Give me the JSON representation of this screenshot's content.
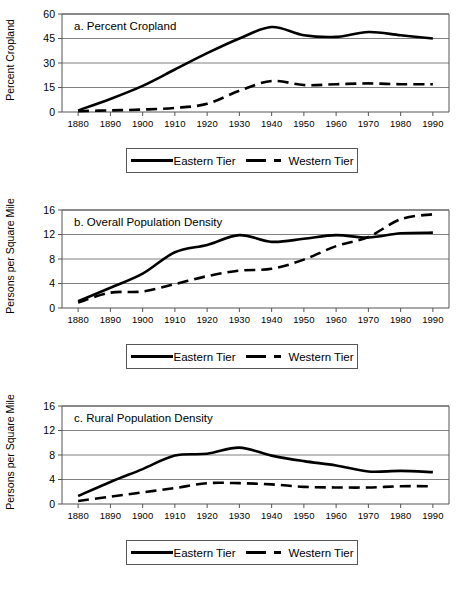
{
  "figure": {
    "x_tick_labels": [
      "1880",
      "1890",
      "1900",
      "1910",
      "1920",
      "1930",
      "1940",
      "1950",
      "1960",
      "1970",
      "1980",
      "1990"
    ],
    "legend": {
      "eastern_label": "Eastern Tier",
      "western_label": "Western Tier",
      "eastern_icon": "solid-line-icon",
      "western_icon": "dashed-line-icon"
    },
    "colors": {
      "series": "#000000",
      "gridline": "#808080",
      "axis": "#555555",
      "background": "#ffffff"
    }
  },
  "chart_data": [
    {
      "type": "line",
      "title": "a. Percent Cropland",
      "xlabel": "",
      "ylabel": "Percent Cropland",
      "xlim": [
        1875,
        1995
      ],
      "ylim": [
        0,
        60
      ],
      "yticks": [
        0,
        15,
        30,
        45,
        60
      ],
      "ytick_labels": [
        "0",
        "15",
        "30",
        "45",
        "60"
      ],
      "grid": true,
      "legend_position": "below",
      "x": [
        1880,
        1890,
        1900,
        1910,
        1920,
        1930,
        1940,
        1950,
        1960,
        1970,
        1980,
        1990
      ],
      "series": [
        {
          "name": "Eastern Tier",
          "style": "solid",
          "values": [
            1,
            8,
            16,
            26,
            36,
            45,
            52,
            47,
            46,
            49,
            47,
            45
          ]
        },
        {
          "name": "Western Tier",
          "style": "dashed",
          "values": [
            0.5,
            1,
            1.5,
            2.5,
            5,
            13,
            19,
            16.5,
            17,
            17.5,
            17,
            17
          ]
        }
      ]
    },
    {
      "type": "line",
      "title": "b. Overall Population Density",
      "xlabel": "",
      "ylabel": "Persons per Square Mile",
      "xlim": [
        1875,
        1995
      ],
      "ylim": [
        0,
        16
      ],
      "yticks": [
        0,
        4,
        8,
        12,
        16
      ],
      "ytick_labels": [
        "0",
        "4",
        "8",
        "12",
        "16"
      ],
      "grid": true,
      "legend_position": "below",
      "x": [
        1880,
        1890,
        1900,
        1910,
        1920,
        1930,
        1940,
        1950,
        1960,
        1970,
        1980,
        1990
      ],
      "series": [
        {
          "name": "Eastern Tier",
          "style": "solid",
          "values": [
            1.1,
            3.3,
            5.6,
            9.1,
            10.3,
            11.9,
            10.8,
            11.3,
            11.9,
            11.5,
            12.2,
            12.3
          ]
        },
        {
          "name": "Western Tier",
          "style": "dashed",
          "values": [
            0.9,
            2.5,
            2.7,
            3.9,
            5.2,
            6.1,
            6.4,
            7.9,
            10.1,
            11.6,
            14.5,
            15.3
          ]
        }
      ]
    },
    {
      "type": "line",
      "title": "c. Rural Population Density",
      "xlabel": "",
      "ylabel": "Persons per Square Mile",
      "xlim": [
        1875,
        1995
      ],
      "ylim": [
        0,
        16
      ],
      "yticks": [
        0,
        4,
        8,
        12,
        16
      ],
      "ytick_labels": [
        "0",
        "4",
        "8",
        "12",
        "16"
      ],
      "grid": true,
      "legend_position": "below",
      "x": [
        1880,
        1890,
        1900,
        1910,
        1920,
        1930,
        1940,
        1950,
        1960,
        1970,
        1980,
        1990
      ],
      "series": [
        {
          "name": "Eastern Tier",
          "style": "solid",
          "values": [
            1.3,
            3.6,
            5.7,
            7.9,
            8.2,
            9.2,
            7.9,
            7.0,
            6.3,
            5.3,
            5.4,
            5.2
          ]
        },
        {
          "name": "Western Tier",
          "style": "dashed",
          "values": [
            0.5,
            1.2,
            1.9,
            2.6,
            3.4,
            3.4,
            3.2,
            2.8,
            2.7,
            2.7,
            2.9,
            2.9
          ]
        }
      ]
    }
  ]
}
